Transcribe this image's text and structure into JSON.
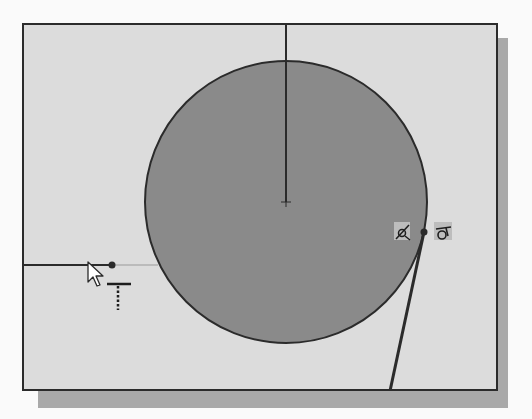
{
  "scene": {
    "type": "cad-sketch",
    "description": "Sketch of circle with tangent line, cursor drawing horizontal line"
  },
  "colors": {
    "background": "#fafafa",
    "viewport": "#dcdcdc",
    "shadow": "#a9a9a9",
    "circle_fill": "#8a8a8a",
    "stroke": "#2b2b2b",
    "preview_line": "#9a9a9a",
    "icon_bg": "#bdbdbd"
  },
  "geometry": {
    "circle": {
      "cx": 286,
      "cy": 202,
      "r": 141
    },
    "center_mark": {
      "x": 286,
      "y": 202
    },
    "vertical_line": {
      "x1": 286,
      "y1": 23,
      "x2": 286,
      "y2": 202
    },
    "horizontal_line": {
      "x1": 22,
      "y1": 265,
      "x2": 112,
      "y2": 265
    },
    "preview_line": {
      "x1": 112,
      "y1": 265,
      "x2": 160,
      "y2": 265
    },
    "endpoint_dot_left": {
      "x": 112,
      "y": 265
    },
    "tangent_line": {
      "x1": 424,
      "y1": 232,
      "x2": 390,
      "y2": 391
    },
    "tangent_dot": {
      "x": 424,
      "y": 232
    }
  },
  "icons": {
    "cursor": "arrow-pointer-icon",
    "horizontal_constraint": "horizontal-constraint-icon",
    "tangent_constraint": "tangent-constraint-icon",
    "coincident_constraint": "coincident-constraint-icon"
  },
  "labels": {
    "viewport": "Sketch graphics area"
  }
}
